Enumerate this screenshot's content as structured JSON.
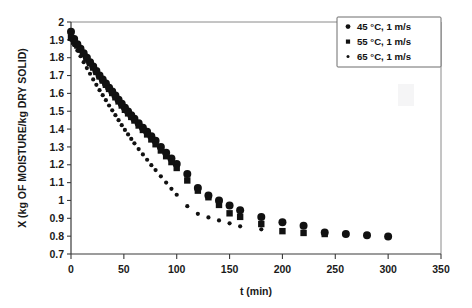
{
  "figure": {
    "background": "#ffffff",
    "ink_color": "#111111",
    "axis_color": "#3a3a3a"
  },
  "chart_data": {
    "type": "scatter",
    "title": "",
    "xlabel": "t (min)",
    "ylabel": "X (kg OF MOISTURE/kg DRY SOLID)",
    "xlim": [
      0,
      350
    ],
    "ylim": [
      0.7,
      2
    ],
    "xticks": [
      0,
      50,
      100,
      150,
      200,
      250,
      300,
      350
    ],
    "yticks": [
      0.7,
      0.8,
      0.9,
      1,
      1.1,
      1.2,
      1.3,
      1.4,
      1.5,
      1.6,
      1.7,
      1.8,
      1.9,
      2
    ],
    "xtick_labels": [
      "0",
      "50",
      "100",
      "150",
      "200",
      "250",
      "300",
      "350"
    ],
    "ytick_labels": [
      "0.7",
      "0.8",
      "0.9",
      "1",
      "1.1",
      "1.2",
      "1.3",
      "1.4",
      "1.5",
      "1.6",
      "1.7",
      "1.8",
      "1.9",
      "2"
    ],
    "grid": false,
    "legend_position": "top-right",
    "series": [
      {
        "name": "45 °C, 1 m/s",
        "marker": "circle",
        "marker_size": 4.0,
        "color": "#111111",
        "x": [
          0,
          3,
          6,
          9,
          12,
          15,
          18,
          21,
          24,
          27,
          30,
          33,
          36,
          39,
          42,
          45,
          48,
          51,
          54,
          57,
          60,
          64,
          68,
          72,
          76,
          80,
          85,
          90,
          95,
          100,
          110,
          120,
          130,
          140,
          150,
          160,
          180,
          200,
          220,
          240,
          260,
          280,
          300
        ],
        "y": [
          1.945,
          1.905,
          1.875,
          1.85,
          1.825,
          1.8,
          1.775,
          1.75,
          1.725,
          1.7,
          1.678,
          1.655,
          1.632,
          1.61,
          1.588,
          1.565,
          1.542,
          1.52,
          1.498,
          1.478,
          1.458,
          1.432,
          1.408,
          1.385,
          1.36,
          1.335,
          1.3,
          1.268,
          1.235,
          1.205,
          1.148,
          1.07,
          1.028,
          1.0,
          0.972,
          0.945,
          0.908,
          0.878,
          0.858,
          0.82,
          0.812,
          0.805,
          0.798
        ]
      },
      {
        "name": "55 °C, 1 m/s",
        "marker": "square",
        "marker_size": 3.2,
        "color": "#111111",
        "x": [
          0,
          3,
          6,
          9,
          12,
          15,
          18,
          21,
          24,
          27,
          30,
          33,
          36,
          39,
          42,
          45,
          48,
          51,
          54,
          57,
          60,
          64,
          68,
          72,
          76,
          80,
          85,
          90,
          95,
          100,
          110,
          120,
          130,
          140,
          150,
          160,
          180,
          200,
          220,
          240
        ],
        "y": [
          1.912,
          1.89,
          1.868,
          1.845,
          1.82,
          1.795,
          1.77,
          1.745,
          1.72,
          1.695,
          1.672,
          1.648,
          1.625,
          1.602,
          1.578,
          1.555,
          1.532,
          1.508,
          1.488,
          1.468,
          1.448,
          1.42,
          1.395,
          1.37,
          1.342,
          1.315,
          1.28,
          1.248,
          1.215,
          1.182,
          1.112,
          1.055,
          1.018,
          0.975,
          0.928,
          0.908,
          0.868,
          0.828,
          0.818,
          0.812
        ]
      },
      {
        "name": "65 °C, 1 m/s",
        "marker": "dot",
        "marker_size": 2.1,
        "color": "#111111",
        "x": [
          0,
          3,
          6,
          9,
          12,
          15,
          18,
          21,
          24,
          27,
          30,
          33,
          36,
          39,
          42,
          45,
          48,
          51,
          54,
          57,
          60,
          64,
          68,
          72,
          76,
          80,
          85,
          90,
          95,
          100,
          110,
          120,
          130,
          140,
          150,
          160,
          180
        ],
        "y": [
          1.9,
          1.87,
          1.84,
          1.808,
          1.775,
          1.742,
          1.71,
          1.678,
          1.648,
          1.618,
          1.59,
          1.562,
          1.532,
          1.505,
          1.478,
          1.45,
          1.422,
          1.395,
          1.37,
          1.345,
          1.32,
          1.288,
          1.258,
          1.228,
          1.198,
          1.17,
          1.135,
          1.1,
          1.065,
          1.032,
          0.968,
          0.925,
          0.905,
          0.888,
          0.872,
          0.855,
          0.838
        ]
      }
    ]
  },
  "legend": {
    "items": [
      {
        "label": "45 °C, 1 m/s",
        "marker": "circle"
      },
      {
        "label": "55 °C, 1 m/s",
        "marker": "square"
      },
      {
        "label": "65 °C, 1 m/s",
        "marker": "dot"
      }
    ]
  }
}
